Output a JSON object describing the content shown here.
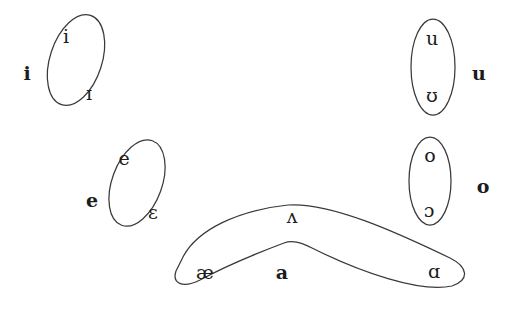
{
  "diagram": {
    "type": "vowel-grouping-diagram",
    "background_color": "#ffffff",
    "stroke_color": "#3a3a3a",
    "text_color": "#1c1c1c",
    "groups": [
      {
        "id": "group-i",
        "label": "i",
        "label_x": 27,
        "label_y": 73,
        "shape": "ellipse",
        "cx": 76,
        "cy": 60,
        "rx": 26,
        "ry": 47,
        "rotation": 18,
        "members": [
          {
            "symbol": "i",
            "x": 66,
            "y": 36
          },
          {
            "symbol": "ɪ",
            "x": 89,
            "y": 93
          }
        ]
      },
      {
        "id": "group-e",
        "label": "e",
        "label_x": 92,
        "label_y": 200,
        "shape": "ellipse",
        "cx": 137,
        "cy": 183,
        "rx": 25,
        "ry": 45,
        "rotation": 20,
        "members": [
          {
            "symbol": "e",
            "x": 124,
            "y": 158
          },
          {
            "symbol": "ɛ",
            "x": 153,
            "y": 212
          }
        ]
      },
      {
        "id": "group-u",
        "label": "u",
        "label_x": 479,
        "label_y": 73,
        "shape": "ellipse",
        "cx": 433,
        "cy": 67,
        "rx": 22,
        "ry": 48,
        "rotation": 0,
        "members": [
          {
            "symbol": "u",
            "x": 432,
            "y": 38
          },
          {
            "symbol": "ʊ",
            "x": 432,
            "y": 95
          }
        ]
      },
      {
        "id": "group-o",
        "label": "o",
        "label_x": 483,
        "label_y": 186,
        "shape": "ellipse",
        "cx": 430,
        "cy": 181,
        "rx": 21,
        "ry": 44,
        "rotation": 0,
        "members": [
          {
            "symbol": "o",
            "x": 430,
            "y": 155
          },
          {
            "symbol": "ɔ",
            "x": 429,
            "y": 210
          }
        ]
      },
      {
        "id": "group-a",
        "label": "a",
        "label_x": 282,
        "label_y": 272,
        "shape": "boomerang",
        "members": [
          {
            "symbol": "æ",
            "x": 205,
            "y": 272
          },
          {
            "symbol": "ʌ",
            "x": 292,
            "y": 216
          },
          {
            "symbol": "ɑ",
            "x": 434,
            "y": 271
          }
        ]
      }
    ]
  }
}
